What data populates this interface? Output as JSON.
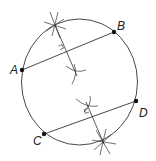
{
  "diagram": {
    "points": [
      {
        "label": "A",
        "x": 22,
        "y": 70
      },
      {
        "label": "B",
        "x": 114,
        "y": 32
      },
      {
        "label": "C",
        "x": 44,
        "y": 134
      },
      {
        "label": "D",
        "x": 136,
        "y": 101
      }
    ],
    "chords": [
      {
        "from": "A",
        "to": "B"
      },
      {
        "from": "C",
        "to": "D"
      }
    ],
    "colors": {
      "stroke": "#333333",
      "point": "#111111",
      "background": "#ffffff"
    }
  },
  "labels": {
    "A": "A",
    "B": "B",
    "C": "C",
    "D": "D"
  }
}
